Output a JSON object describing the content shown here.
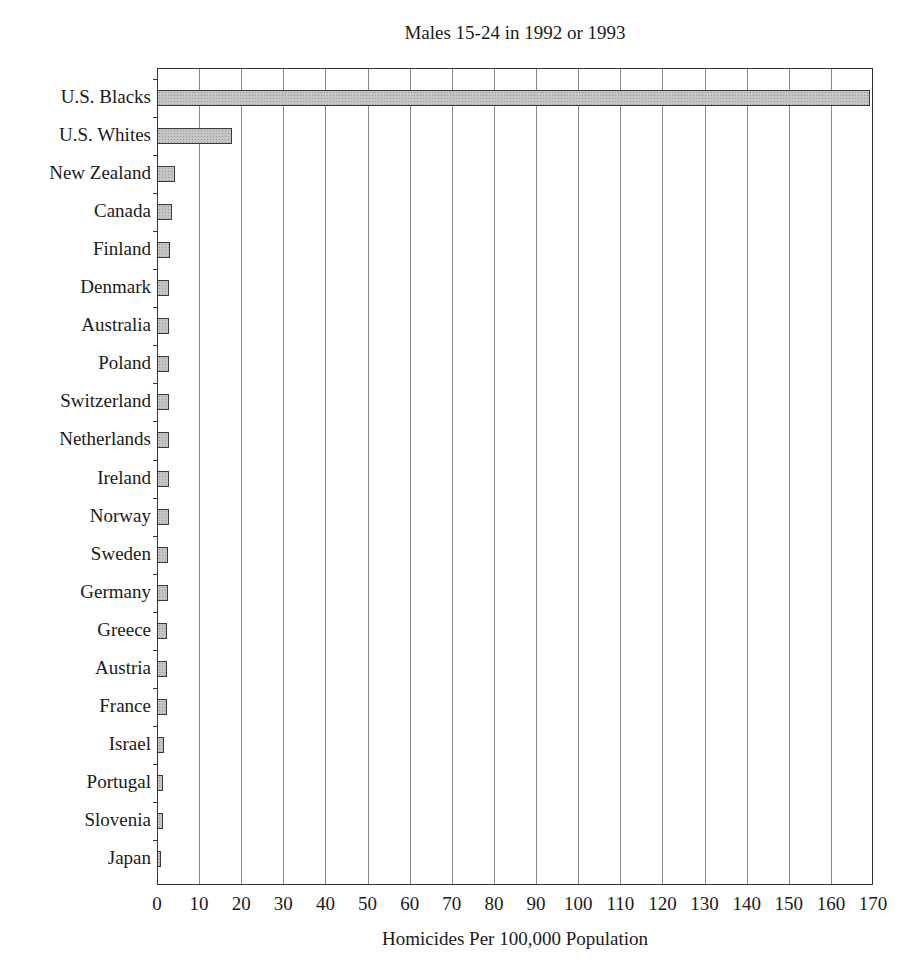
{
  "chart_data": {
    "type": "bar",
    "orientation": "horizontal",
    "title": "Males 15-24 in 1992 or 1993",
    "xlabel": "Homicides Per 100,000 Population",
    "ylabel": "",
    "xlim": [
      0,
      170
    ],
    "xticks": [
      0,
      10,
      20,
      30,
      40,
      50,
      60,
      70,
      80,
      90,
      100,
      110,
      120,
      130,
      140,
      150,
      160,
      170
    ],
    "grid": true,
    "legend": null,
    "categories": [
      "U.S. Blacks",
      "U.S. Whites",
      "New Zealand",
      "Canada",
      "Finland",
      "Denmark",
      "Australia",
      "Poland",
      "Switzerland",
      "Netherlands",
      "Ireland",
      "Norway",
      "Sweden",
      "Germany",
      "Greece",
      "Austria",
      "France",
      "Israel",
      "Portugal",
      "Slovenia",
      "Japan"
    ],
    "values": [
      169,
      17.5,
      4.0,
      3.4,
      2.8,
      2.7,
      2.6,
      2.5,
      2.5,
      2.5,
      2.5,
      2.5,
      2.4,
      2.4,
      2.2,
      2.2,
      2.2,
      1.4,
      1.2,
      1.2,
      0.6
    ],
    "bar_color": "#c4c4c4",
    "bar_edge_color": "#3a3a3a"
  }
}
